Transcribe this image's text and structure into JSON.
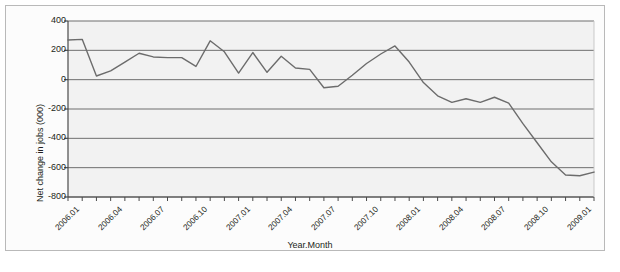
{
  "chart_data": {
    "type": "line",
    "title": "",
    "xlabel": "Year.Month",
    "ylabel": "Net change in jobs (000)",
    "ylim": [
      -800,
      400
    ],
    "ytick_values": [
      400,
      200,
      0,
      -200,
      -400,
      -600,
      -800
    ],
    "ytick_labels": [
      "400",
      "200",
      "0",
      "-200",
      "-400",
      "-600",
      "-800"
    ],
    "grid": "horizontal",
    "legend": "none",
    "x": [
      "2006.01",
      "2006.02",
      "2006.03",
      "2006.04",
      "2006.05",
      "2006.06",
      "2006.07",
      "2006.08",
      "2006.09",
      "2006.10",
      "2006.11",
      "2006.12",
      "2007.01",
      "2007.02",
      "2007.03",
      "2007.04",
      "2007.05",
      "2007.06",
      "2007.07",
      "2007.08",
      "2007.09",
      "2007.10",
      "2007.11",
      "2007.12",
      "2008.01",
      "2008.02",
      "2008.03",
      "2008.04",
      "2008.05",
      "2008.06",
      "2008.07",
      "2008.08",
      "2008.09",
      "2008.10",
      "2008.11",
      "2008.12",
      "2009.01",
      "2009.02"
    ],
    "xtick_labels": [
      "2006.01",
      "2006.04",
      "2006.07",
      "2006.10",
      "2007.01",
      "2007.04",
      "2007.07",
      "2007.10",
      "2008.01",
      "2008.04",
      "2008.07",
      "2008.10",
      "2009.01"
    ],
    "xtick_indices": [
      0,
      3,
      6,
      9,
      12,
      15,
      18,
      21,
      24,
      27,
      30,
      33,
      36
    ],
    "values": [
      270,
      275,
      25,
      60,
      120,
      180,
      155,
      150,
      150,
      90,
      265,
      190,
      45,
      185,
      50,
      160,
      80,
      70,
      -55,
      -45,
      30,
      110,
      175,
      230,
      120,
      -20,
      -110,
      -155,
      -130,
      -155,
      -120,
      -160,
      -300,
      -430,
      -560,
      -650,
      -655,
      -630
    ],
    "line_color": "#6c6c6c",
    "grid_color": "#6f6f6f",
    "axis_color": "#4a4a4a",
    "plot_bg": "#f2f2f2"
  }
}
